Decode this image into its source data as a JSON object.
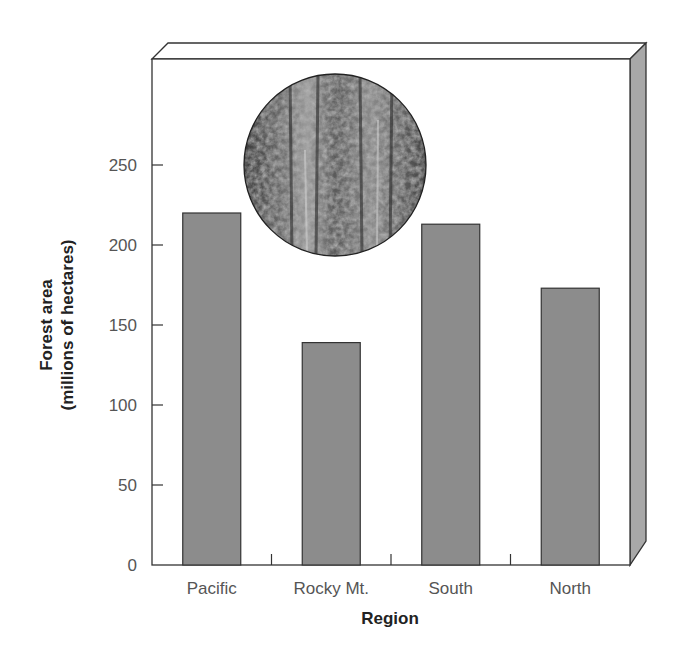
{
  "chart_data": {
    "type": "bar",
    "title": "",
    "categories": [
      "Pacific",
      "Rocky Mt.",
      "South",
      "North"
    ],
    "values": [
      220,
      139,
      213,
      173
    ],
    "xlabel": "Region",
    "ylabel_line1": "Forest area",
    "ylabel_line2": "(millions of hectares)",
    "ylim": [
      0,
      300
    ],
    "yticks": [
      0,
      50,
      100,
      150,
      200,
      250
    ],
    "grid": false,
    "legend": null,
    "style": {
      "bar_color": "#8c8c8c",
      "bar_edge": "#333333",
      "frame_side_color": "#a8a8a8",
      "inset_image": "circular forest photograph"
    }
  }
}
